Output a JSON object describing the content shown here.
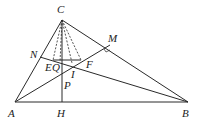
{
  "diagram": {
    "type": "geometry",
    "stroke_color": "#2a2a2a",
    "points": {
      "C": {
        "label": "C",
        "x": 62,
        "y": 20,
        "lx": 57,
        "ly": 13
      },
      "A": {
        "label": "A",
        "x": 15,
        "y": 102,
        "lx": 8,
        "ly": 117
      },
      "B": {
        "label": "B",
        "x": 188,
        "y": 102,
        "lx": 182,
        "ly": 117
      },
      "H": {
        "label": "H",
        "x": 62,
        "y": 102,
        "lx": 56,
        "ly": 117
      },
      "N": {
        "label": "N",
        "x": 40,
        "y": 57,
        "lx": 30,
        "ly": 58
      },
      "M": {
        "label": "M",
        "x": 110,
        "y": 45,
        "lx": 108,
        "ly": 42
      },
      "E": {
        "label": "E",
        "x": 53,
        "y": 60,
        "lx": 46,
        "ly": 71
      },
      "Q": {
        "label": "Q",
        "x": 60,
        "y": 62,
        "lx": 54,
        "ly": 71
      },
      "F": {
        "label": "F",
        "x": 81,
        "y": 60,
        "lx": 86,
        "ly": 68
      },
      "I": {
        "label": "I",
        "x": 72,
        "y": 63,
        "lx": 71,
        "ly": 77
      },
      "P": {
        "label": "P",
        "x": 62,
        "y": 80,
        "lx": 64,
        "ly": 88
      }
    },
    "solid_segments": [
      [
        "A",
        "C"
      ],
      [
        "C",
        "B"
      ],
      [
        "A",
        "B"
      ],
      [
        "C",
        "H"
      ],
      [
        "A",
        "M"
      ],
      [
        "N",
        "B"
      ],
      [
        "E",
        "F"
      ]
    ],
    "dashed_segments": [
      [
        "C",
        "E"
      ],
      [
        "C",
        "Q"
      ],
      [
        "C",
        "I"
      ],
      [
        "C",
        "F"
      ]
    ]
  }
}
